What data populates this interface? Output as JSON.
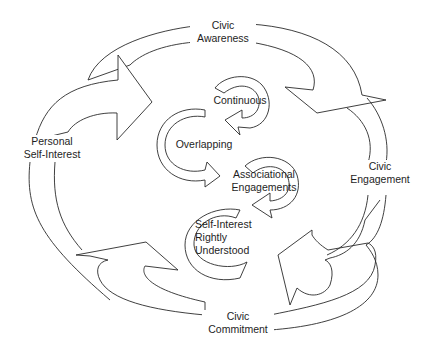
{
  "diagram": {
    "outer_cycle": {
      "civic_awareness": {
        "line1": "Civic",
        "line2": "Awareness"
      },
      "civic_engagement": {
        "line1": "Civic",
        "line2": "Engagement"
      },
      "civic_commitment": {
        "line1": "Civic",
        "line2": "Commitment"
      },
      "personal_self_interest": {
        "line1": "Personal",
        "line2": "Self-Interest"
      }
    },
    "inner_cycle": {
      "continuous": "Continuous",
      "overlapping": "Overlapping",
      "associational_engagements": {
        "line1": "Associational",
        "line2": "Engagements"
      },
      "self_interest_rightly_understood": {
        "line1": "Self-Interest",
        "line2": "Rightly",
        "line3": "Understood"
      }
    },
    "colors": {
      "stroke": "#2a2a2a",
      "background": "#ffffff",
      "text": "#1e1e1e"
    }
  }
}
